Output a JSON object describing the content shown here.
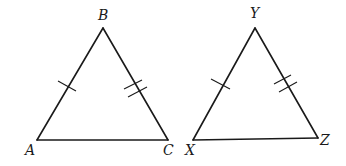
{
  "diagram": {
    "type": "geometry",
    "stroke_color": "#1a1a1a",
    "background": "#ffffff",
    "triangles": [
      {
        "name": "ABC",
        "vertices": {
          "A": {
            "label": "A",
            "x": 37,
            "y": 140
          },
          "B": {
            "label": "B",
            "x": 103,
            "y": 28
          },
          "C": {
            "label": "C",
            "x": 168,
            "y": 140
          }
        },
        "tick_marks": [
          {
            "side": "AB",
            "count": 1
          },
          {
            "side": "BC",
            "count": 2
          }
        ]
      },
      {
        "name": "XYZ",
        "vertices": {
          "X": {
            "label": "X",
            "x": 193,
            "y": 140
          },
          "Y": {
            "label": "Y",
            "x": 255,
            "y": 28
          },
          "Z": {
            "label": "Z",
            "x": 318,
            "y": 138
          }
        },
        "tick_marks": [
          {
            "side": "XY",
            "count": 1
          },
          {
            "side": "YZ",
            "count": 2
          }
        ]
      }
    ]
  },
  "labels": {
    "A": "A",
    "B": "B",
    "C": "C",
    "X": "X",
    "Y": "Y",
    "Z": "Z"
  }
}
